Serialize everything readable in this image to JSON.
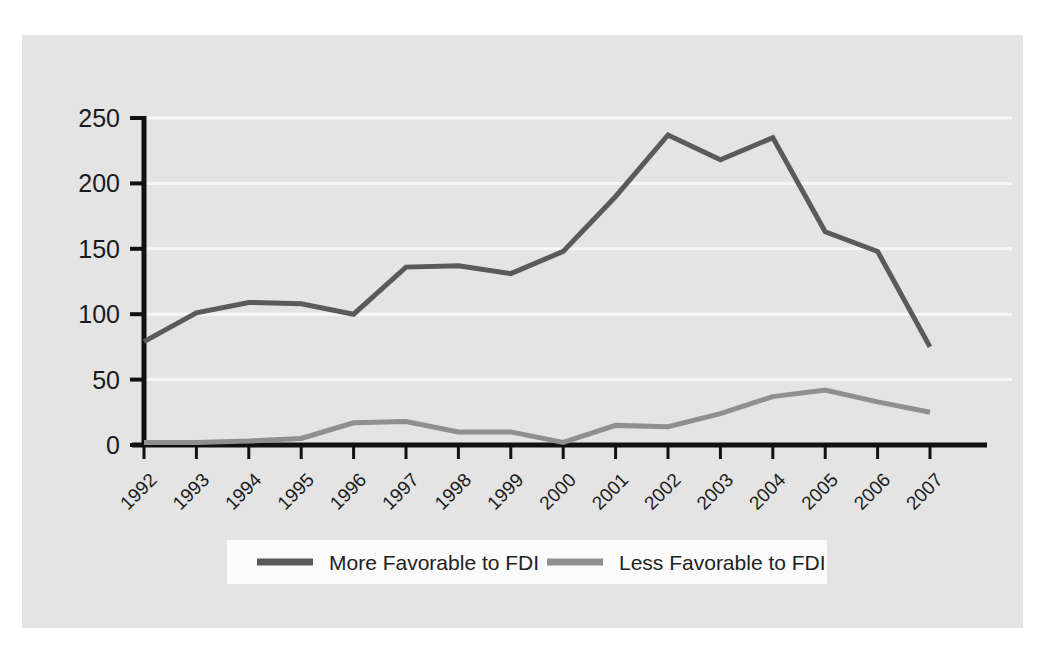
{
  "figure": {
    "background_color": "#ffffff",
    "panel_color": "#e4e4e4",
    "header_rule_thin_color": "#d2d2d2",
    "header_rule_thick_color": "#b8b8b8"
  },
  "chart_data": {
    "type": "line",
    "title": "",
    "subtitle": "",
    "xlabel": "",
    "ylabel": "",
    "categories": [
      "1992",
      "1993",
      "1994",
      "1995",
      "1996",
      "1997",
      "1998",
      "1999",
      "2000",
      "2001",
      "2002",
      "2003",
      "2004",
      "2005",
      "2006",
      "2007"
    ],
    "x": [
      1992,
      1993,
      1994,
      1995,
      1996,
      1997,
      1998,
      1999,
      2000,
      2001,
      2002,
      2003,
      2004,
      2005,
      2006,
      2007
    ],
    "ylim": [
      0,
      250
    ],
    "yticks": [
      0,
      50,
      100,
      150,
      200,
      250
    ],
    "ytick_labels": [
      "0",
      "50",
      "100",
      "150",
      "200",
      "250"
    ],
    "xtick_rotation": 45,
    "grid": "horizontal",
    "grid_color": "#f7f7f7",
    "axis_color": "#111111",
    "legend_position": "bottom",
    "legend_background": "#fbfbfb",
    "series": [
      {
        "name": "More Favorable to FDI",
        "color": "#5a5a5a",
        "line_width": 5,
        "values": [
          79,
          101,
          109,
          108,
          100,
          136,
          137,
          131,
          148,
          190,
          237,
          218,
          235,
          163,
          148,
          75
        ]
      },
      {
        "name": "Less Favorable to FDI",
        "color": "#8f8f8f",
        "line_width": 5,
        "values": [
          2,
          2,
          3,
          5,
          17,
          18,
          10,
          10,
          2,
          15,
          14,
          24,
          37,
          42,
          33,
          25
        ]
      }
    ]
  }
}
